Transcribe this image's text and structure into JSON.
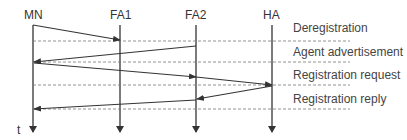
{
  "diagram": {
    "entities": [
      {
        "id": "MN",
        "label": "MN",
        "x": 33
      },
      {
        "id": "FA1",
        "label": "FA1",
        "x": 120
      },
      {
        "id": "FA2",
        "label": "FA2",
        "x": 196
      },
      {
        "id": "HA",
        "label": "HA",
        "x": 272
      }
    ],
    "time_axis_label": "t",
    "messages": [
      {
        "label": "Deregistration"
      },
      {
        "label": "Agent advertisement"
      },
      {
        "label": "Registration request"
      },
      {
        "label": "Registration reply"
      }
    ],
    "colors": {
      "line": "#333333",
      "dashed": "#666666",
      "text": "#333333"
    }
  }
}
